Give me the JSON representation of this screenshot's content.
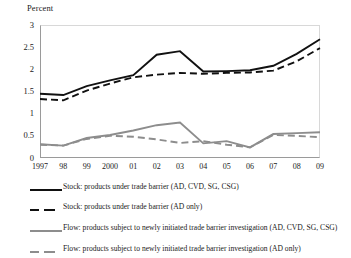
{
  "chart_data": {
    "type": "line",
    "title": "",
    "ylabel": "Percent",
    "xlabel": "",
    "ylim": [
      0,
      3
    ],
    "ytick_values": [
      3,
      2.5,
      2,
      1.5,
      1,
      0.5,
      0
    ],
    "ytick_labels": [
      "3",
      "2.5",
      "2",
      "1.5",
      "1",
      "0.5",
      "0"
    ],
    "grid": false,
    "legend_position": "below",
    "categories": [
      "1997",
      "98",
      "99",
      "2000",
      "01",
      "02",
      "03",
      "04",
      "05",
      "06",
      "07",
      "08",
      "09"
    ],
    "x": [
      1997,
      1998,
      1999,
      2000,
      2001,
      2002,
      2003,
      2004,
      2005,
      2006,
      2007,
      2008,
      2009
    ],
    "series": [
      {
        "name": "Stock: products under trade barrier (AD, CVD, SG, CSG)",
        "color": "#111111",
        "style": "solid",
        "width": 1.9,
        "values": [
          1.45,
          1.42,
          1.62,
          1.75,
          1.87,
          2.33,
          2.41,
          1.95,
          1.96,
          1.98,
          2.08,
          2.35,
          2.68
        ]
      },
      {
        "name": "Stock: products under trade barrier (AD only)",
        "color": "#111111",
        "style": "dashed",
        "width": 1.9,
        "values": [
          1.33,
          1.3,
          1.52,
          1.68,
          1.82,
          1.88,
          1.92,
          1.9,
          1.92,
          1.93,
          1.97,
          2.18,
          2.48
        ]
      },
      {
        "name": "Flow: products subject to newly initiated trade barrier investigation (AD, CVD, SG, CSG)",
        "color": "#8d8d8d",
        "style": "solid",
        "width": 1.9,
        "values": [
          0.31,
          0.28,
          0.45,
          0.52,
          0.62,
          0.74,
          0.8,
          0.33,
          0.38,
          0.24,
          0.54,
          0.56,
          0.58
        ]
      },
      {
        "name": "Flow: products subject to newly initiated trade barrier investigation (AD only)",
        "color": "#8d8d8d",
        "style": "dashed",
        "width": 1.9,
        "values": [
          0.3,
          0.28,
          0.43,
          0.5,
          0.48,
          0.42,
          0.34,
          0.38,
          0.3,
          0.24,
          0.52,
          0.5,
          0.47
        ]
      }
    ]
  },
  "axis": {
    "y_axis_label": "Percent",
    "y_ticks": [
      "3",
      "2.5",
      "2",
      "1.5",
      "1",
      "0.5",
      "0"
    ],
    "x_ticks": [
      "1997",
      "98",
      "99",
      "2000",
      "01",
      "02",
      "03",
      "04",
      "05",
      "06",
      "07",
      "08",
      "09"
    ]
  },
  "legend": {
    "entries": [
      {
        "label": "Stock: products under trade barrier (AD, CVD, SG, CSG)",
        "color": "#111111",
        "style": "solid"
      },
      {
        "label": "Stock: products under trade barrier (AD only)",
        "color": "#111111",
        "style": "dashed"
      },
      {
        "label": "Flow: products subject to newly initiated trade barrier investigation (AD, CVD, SG, CSG)",
        "color": "#8d8d8d",
        "style": "solid"
      },
      {
        "label": "Flow: products subject to newly initiated trade barrier investigation (AD only)",
        "color": "#8d8d8d",
        "style": "dashed"
      }
    ]
  },
  "colors": {
    "stock": "#111111",
    "flow": "#8d8d8d",
    "axis": "#9a9a9a",
    "text": "#1a1a1a",
    "background": "#ffffff"
  }
}
